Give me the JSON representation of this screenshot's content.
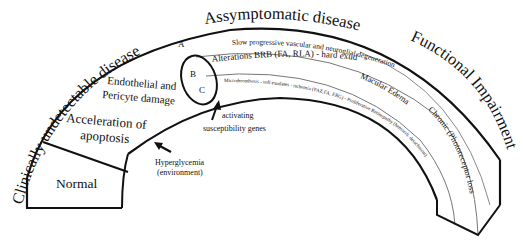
{
  "stages": {
    "clinically_undetectable": "Clinically undetectable disease",
    "assymptomatic": "Assymptomatic disease",
    "functional_impairment": "Functional Impairment"
  },
  "blocks": {
    "normal": "Normal",
    "acceleration_line1": "Acceleration of",
    "acceleration_line2": "apoptosis",
    "endothelial_line1": "Endothelial and",
    "endothelial_line2": "Pericyte damage"
  },
  "bands": {
    "a_marker": "A",
    "b_marker": "B",
    "c_marker": "C",
    "band_a": "Slow progressive vascular and neuroglial degeneration",
    "band_b": "Alterations BRB (FA, RLA) - hard exudates",
    "band_b_extra": "Macular Edema",
    "band_c": "Microthrombosis - soft exudates - ischemia (FAZ,FA, ERG) - Proliferative Retinopathy (hemorrh. detachment)",
    "band_a_extra": "Chronic (Photoreceptor loss)"
  },
  "annotations": {
    "hyperglycemia_line1": "Hyperglycemia",
    "hyperglycemia_line2": "(environment)",
    "genes_line1": "activating",
    "genes_line2": "susceptibility genes"
  }
}
